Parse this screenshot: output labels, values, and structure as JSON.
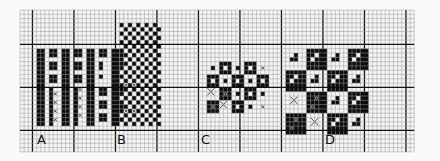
{
  "diagram": {
    "colors": {
      "background": "#fafafa",
      "grid_fine": "#9a9a9a",
      "grid_heavy": "#111111",
      "filled": "#0d0d0d",
      "symbol": "#333333"
    },
    "grid": {
      "origin_x": 20,
      "origin_y": 10,
      "cell_w": 4.15,
      "cell_h": 4.3,
      "cols": 95,
      "rows": 33,
      "heavy_col_offset": 3,
      "heavy_row_offset": 8,
      "heavy_every": 10
    },
    "panels": [
      {
        "id": "A",
        "label": "A",
        "label_col": 4,
        "label_row": 28,
        "blocks": [
          {
            "col": 4,
            "row": 9,
            "w": 2,
            "h": 9
          },
          {
            "col": 7,
            "row": 9,
            "w": 2,
            "h": 2
          },
          {
            "col": 7,
            "row": 12,
            "w": 2,
            "h": 2
          },
          {
            "col": 7,
            "row": 15,
            "w": 2,
            "h": 2
          },
          {
            "col": 10,
            "row": 9,
            "w": 2,
            "h": 9
          },
          {
            "col": 13,
            "row": 9,
            "w": 2,
            "h": 2
          },
          {
            "col": 13,
            "row": 12,
            "w": 2,
            "h": 2
          },
          {
            "col": 13,
            "row": 15,
            "w": 2,
            "h": 2
          },
          {
            "col": 16,
            "row": 9,
            "w": 2,
            "h": 9
          },
          {
            "col": 19,
            "row": 9,
            "w": 2,
            "h": 2
          },
          {
            "col": 19,
            "row": 12,
            "w": 1,
            "h": 2
          },
          {
            "col": 19,
            "row": 15,
            "w": 1,
            "h": 1
          },
          {
            "col": 22,
            "row": 9,
            "w": 2,
            "h": 9
          },
          {
            "col": 24,
            "row": 9,
            "w": 1,
            "h": 2
          },
          {
            "col": 24,
            "row": 12,
            "w": 1,
            "h": 1
          },
          {
            "col": 4,
            "row": 18,
            "w": 2,
            "h": 9
          },
          {
            "col": 7,
            "row": 18,
            "w": 1,
            "h": 9
          },
          {
            "col": 10,
            "row": 18,
            "w": 2,
            "h": 9
          },
          {
            "col": 13,
            "row": 18,
            "w": 1,
            "h": 9
          },
          {
            "col": 16,
            "row": 18,
            "w": 2,
            "h": 9
          },
          {
            "col": 19,
            "row": 18,
            "w": 2,
            "h": 2
          },
          {
            "col": 19,
            "row": 21,
            "w": 2,
            "h": 2
          },
          {
            "col": 19,
            "row": 24,
            "w": 2,
            "h": 2
          },
          {
            "col": 22,
            "row": 18,
            "w": 2,
            "h": 9
          },
          {
            "col": 24,
            "row": 18,
            "w": 1,
            "h": 2
          },
          {
            "col": 24,
            "row": 21,
            "w": 1,
            "h": 2
          },
          {
            "col": 24,
            "row": 25,
            "w": 1,
            "h": 1
          }
        ],
        "symbols": [
          {
            "type": "x",
            "col": 8,
            "row": 19
          },
          {
            "type": "x",
            "col": 8,
            "row": 21
          },
          {
            "type": "x",
            "col": 8,
            "row": 23
          },
          {
            "type": "x",
            "col": 8,
            "row": 25
          },
          {
            "type": "x",
            "col": 14,
            "row": 18
          },
          {
            "type": "x",
            "col": 14,
            "row": 20
          },
          {
            "type": "x",
            "col": 14,
            "row": 22
          },
          {
            "type": "x",
            "col": 14,
            "row": 24
          }
        ]
      },
      {
        "id": "B",
        "label": "B",
        "label_col": 24,
        "label_row": 28,
        "checker": {
          "col": 24,
          "row": 3,
          "cols": 10,
          "rows": 24,
          "cell": 2
        },
        "symbols": [
          {
            "type": "x",
            "col": 25,
            "row": 17
          },
          {
            "type": "x",
            "col": 27,
            "row": 17
          },
          {
            "type": "x",
            "col": 25,
            "row": 23
          },
          {
            "type": "x",
            "col": 27,
            "row": 23
          }
        ]
      },
      {
        "id": "C",
        "label": "C",
        "label_col": 44,
        "label_row": 28,
        "tiles": {
          "col": 45,
          "row": 12,
          "size": 3,
          "cols": 5,
          "rows": 5,
          "pattern": [
            "w.b",
            "b.w",
            "w.b",
            "b.w",
            "x",
            "b.w",
            "w.b",
            "b.w",
            "w.b",
            "b.w",
            "w.x",
            "b.o",
            "w.b",
            "b.w",
            "w.b",
            "b.o",
            "w.x",
            "b.w",
            "w.b",
            "x"
          ]
        }
      },
      {
        "id": "D",
        "label": "D",
        "label_col": 64,
        "label_row": 28,
        "tiles": {
          "col": 64,
          "row": 9,
          "size": 5,
          "cols": 4,
          "rows": 4,
          "pattern": [
            "w.d",
            "b.d",
            "w.d",
            "b.d",
            "b.d",
            "w.d",
            "b.d",
            "w.d",
            "w.x",
            "b.o",
            "w.d",
            "b.d",
            "b.o",
            "w.x",
            "b.d",
            "w.d"
          ]
        }
      }
    ]
  }
}
